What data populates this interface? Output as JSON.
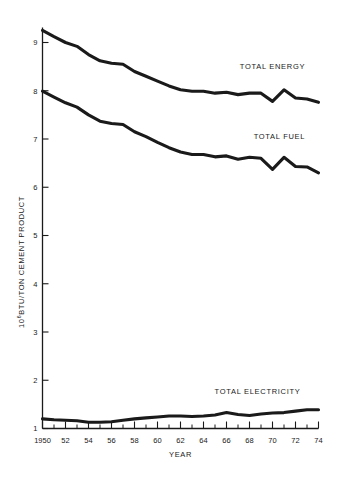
{
  "chart_data": {
    "type": "line",
    "title": "",
    "subtitle": "",
    "xlabel": "YEAR",
    "ylabel": "10^6 BTU/TON CEMENT PRODUCT",
    "ylabel_prefix": "10",
    "ylabel_exponent": "6",
    "ylabel_rest": "BTU/TON CEMENT PRODUCT",
    "xlim": [
      1950,
      1974
    ],
    "ylim": [
      1,
      9.4
    ],
    "grid": false,
    "legend_position": "inline-right",
    "x_tick_labels": [
      "1950",
      "52",
      "54",
      "56",
      "58",
      "60",
      "62",
      "64",
      "66",
      "68",
      "70",
      "72",
      "74"
    ],
    "x_tick_values": [
      1950,
      1952,
      1954,
      1956,
      1958,
      1960,
      1962,
      1964,
      1966,
      1968,
      1970,
      1972,
      1974
    ],
    "x_minor_values": [
      1951,
      1953,
      1955,
      1957,
      1959,
      1961,
      1963,
      1965,
      1967,
      1969,
      1971,
      1973
    ],
    "y_tick_labels": [
      "1",
      "2",
      "3",
      "4",
      "5",
      "6",
      "7",
      "8",
      "9"
    ],
    "y_tick_values": [
      1,
      2,
      3,
      4,
      5,
      6,
      7,
      8,
      9
    ],
    "x": [
      1950,
      1951,
      1952,
      1953,
      1954,
      1955,
      1956,
      1957,
      1958,
      1959,
      1960,
      1961,
      1962,
      1963,
      1964,
      1965,
      1966,
      1967,
      1968,
      1969,
      1970,
      1971,
      1972,
      1973,
      1974
    ],
    "series": [
      {
        "name": "TOTAL ENERGY",
        "label": "TOTAL ENERGY",
        "color": "#1a1a1a",
        "values": [
          9.25,
          9.12,
          9.0,
          8.92,
          8.75,
          8.62,
          8.57,
          8.55,
          8.4,
          8.3,
          8.2,
          8.1,
          8.02,
          7.99,
          7.99,
          7.95,
          7.97,
          7.92,
          7.95,
          7.95,
          7.78,
          8.02,
          7.85,
          7.83,
          7.76
        ]
      },
      {
        "name": "TOTAL FUEL",
        "label": "TOTAL FUEL",
        "color": "#1a1a1a",
        "values": [
          7.99,
          7.87,
          7.75,
          7.66,
          7.5,
          7.37,
          7.32,
          7.3,
          7.15,
          7.05,
          6.93,
          6.82,
          6.73,
          6.68,
          6.68,
          6.63,
          6.65,
          6.58,
          6.62,
          6.6,
          6.37,
          6.62,
          6.43,
          6.42,
          6.3
        ]
      },
      {
        "name": "TOTAL ELECTRICITY",
        "label": "TOTAL ELECTRICITY",
        "color": "#1a1a1a",
        "values": [
          1.2,
          1.18,
          1.17,
          1.16,
          1.13,
          1.13,
          1.14,
          1.17,
          1.2,
          1.22,
          1.24,
          1.26,
          1.26,
          1.25,
          1.26,
          1.28,
          1.33,
          1.29,
          1.27,
          1.3,
          1.32,
          1.33,
          1.36,
          1.39,
          1.39
        ]
      }
    ],
    "annotations": [
      {
        "text": "TOTAL ENERGY",
        "x": 1970.0,
        "y": 8.45
      },
      {
        "text": "TOTAL FUEL",
        "x": 1970.6,
        "y": 7.0
      },
      {
        "text": "TOTAL ELECTRICITY",
        "x": 1968.7,
        "y": 1.72
      }
    ]
  }
}
